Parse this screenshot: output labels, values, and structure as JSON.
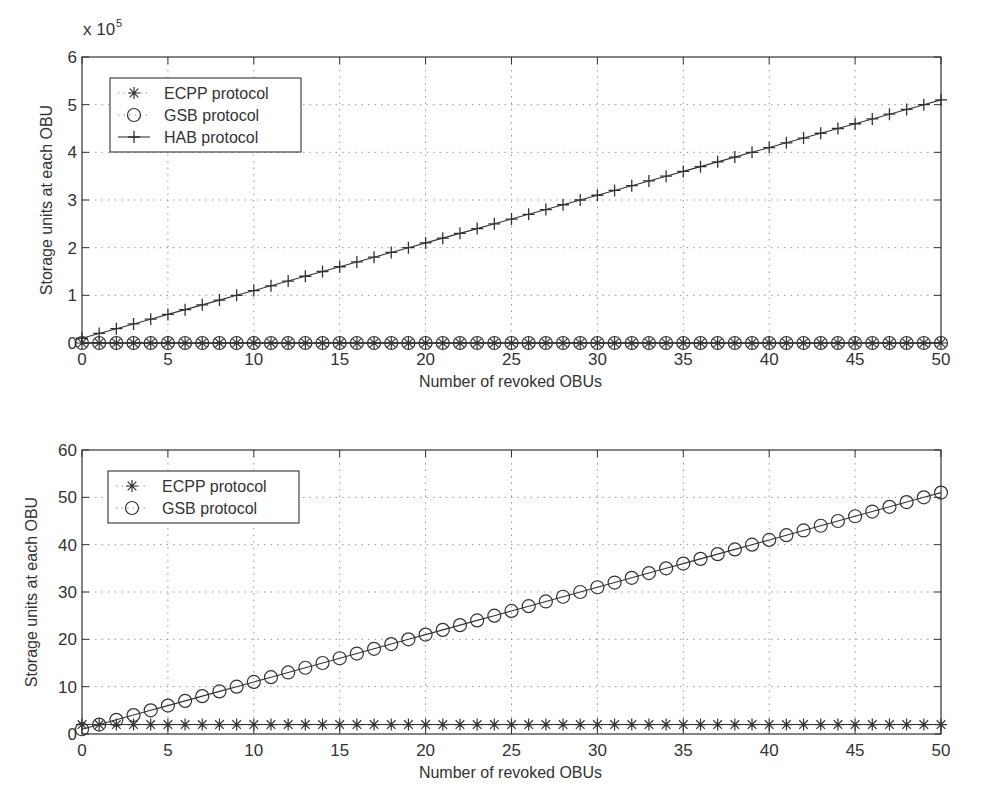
{
  "chart_data": [
    {
      "type": "line",
      "title": "",
      "xlabel": "Number of revoked OBUs",
      "ylabel": "Storage units at each OBU",
      "y_multiplier_label": "x 10",
      "y_multiplier_exponent": "5",
      "xlim": [
        0,
        50
      ],
      "ylim": [
        0,
        6
      ],
      "xticks": [
        "0",
        "5",
        "10",
        "15",
        "20",
        "25",
        "30",
        "35",
        "40",
        "45",
        "50"
      ],
      "yticks": [
        "0",
        "1",
        "2",
        "3",
        "4",
        "5",
        "6"
      ],
      "grid": true,
      "legend_position": "upper left",
      "x": [
        0,
        1,
        2,
        3,
        4,
        5,
        6,
        7,
        8,
        9,
        10,
        11,
        12,
        13,
        14,
        15,
        16,
        17,
        18,
        19,
        20,
        21,
        22,
        23,
        24,
        25,
        26,
        27,
        28,
        29,
        30,
        31,
        32,
        33,
        34,
        35,
        36,
        37,
        38,
        39,
        40,
        41,
        42,
        43,
        44,
        45,
        46,
        47,
        48,
        49,
        50
      ],
      "series": [
        {
          "name": "ECPP protocol",
          "marker": "star",
          "values_scaled_1e5": [
            2e-05,
            2e-05,
            2e-05,
            2e-05,
            2e-05,
            2e-05,
            2e-05,
            2e-05,
            2e-05,
            2e-05,
            2e-05,
            2e-05,
            2e-05,
            2e-05,
            2e-05,
            2e-05,
            2e-05,
            2e-05,
            2e-05,
            2e-05,
            2e-05,
            2e-05,
            2e-05,
            2e-05,
            2e-05,
            2e-05,
            2e-05,
            2e-05,
            2e-05,
            2e-05,
            2e-05,
            2e-05,
            2e-05,
            2e-05,
            2e-05,
            2e-05,
            2e-05,
            2e-05,
            2e-05,
            2e-05,
            2e-05,
            2e-05,
            2e-05,
            2e-05,
            2e-05,
            2e-05,
            2e-05,
            2e-05,
            2e-05,
            2e-05,
            2e-05
          ]
        },
        {
          "name": "GSB protocol",
          "marker": "circle",
          "values_scaled_1e5": [
            1e-05,
            2e-05,
            3e-05,
            4e-05,
            5e-05,
            6e-05,
            7e-05,
            8e-05,
            9e-05,
            0.0001,
            0.00011,
            0.00012,
            0.00013,
            0.00014,
            0.00015,
            0.00016,
            0.00017,
            0.00018,
            0.00019,
            0.0002,
            0.00021,
            0.00022,
            0.00023,
            0.00024,
            0.00025,
            0.00026,
            0.00027,
            0.00028,
            0.00029,
            0.0003,
            0.00031,
            0.00032,
            0.00033,
            0.00034,
            0.00035,
            0.00036,
            0.00037,
            0.00038,
            0.00039,
            0.0004,
            0.00041,
            0.00042,
            0.00043,
            0.00044,
            0.00045,
            0.00046,
            0.00047,
            0.00048,
            0.00049,
            0.0005,
            0.00051
          ]
        },
        {
          "name": "HAB protocol",
          "marker": "plus",
          "values_scaled_1e5": [
            0.1,
            0.2,
            0.3,
            0.4,
            0.5,
            0.6,
            0.7,
            0.8,
            0.9,
            1.0,
            1.1,
            1.2,
            1.3,
            1.4,
            1.5,
            1.6,
            1.7,
            1.8,
            1.9,
            2.0,
            2.1,
            2.2,
            2.3,
            2.4,
            2.5,
            2.6,
            2.7,
            2.8,
            2.9,
            3.0,
            3.1,
            3.2,
            3.3,
            3.4,
            3.5,
            3.6,
            3.7,
            3.8,
            3.9,
            4.0,
            4.1,
            4.2,
            4.3,
            4.4,
            4.5,
            4.6,
            4.7,
            4.8,
            4.9,
            5.0,
            5.1
          ]
        }
      ],
      "plot_box": {
        "x0": 82,
        "x1": 941,
        "y_top": 57,
        "y_bottom": 343
      }
    },
    {
      "type": "line",
      "title": "",
      "xlabel": "Number of revoked OBUs",
      "ylabel": "Storage units at each OBU",
      "xlim": [
        0,
        50
      ],
      "ylim": [
        0,
        60
      ],
      "xticks": [
        "0",
        "5",
        "10",
        "15",
        "20",
        "25",
        "30",
        "35",
        "40",
        "45",
        "50"
      ],
      "yticks": [
        "0",
        "10",
        "20",
        "30",
        "40",
        "50",
        "60"
      ],
      "grid": true,
      "legend_position": "upper left",
      "x": [
        0,
        1,
        2,
        3,
        4,
        5,
        6,
        7,
        8,
        9,
        10,
        11,
        12,
        13,
        14,
        15,
        16,
        17,
        18,
        19,
        20,
        21,
        22,
        23,
        24,
        25,
        26,
        27,
        28,
        29,
        30,
        31,
        32,
        33,
        34,
        35,
        36,
        37,
        38,
        39,
        40,
        41,
        42,
        43,
        44,
        45,
        46,
        47,
        48,
        49,
        50
      ],
      "series": [
        {
          "name": "ECPP protocol",
          "marker": "star",
          "values": [
            2,
            2,
            2,
            2,
            2,
            2,
            2,
            2,
            2,
            2,
            2,
            2,
            2,
            2,
            2,
            2,
            2,
            2,
            2,
            2,
            2,
            2,
            2,
            2,
            2,
            2,
            2,
            2,
            2,
            2,
            2,
            2,
            2,
            2,
            2,
            2,
            2,
            2,
            2,
            2,
            2,
            2,
            2,
            2,
            2,
            2,
            2,
            2,
            2,
            2,
            2
          ]
        },
        {
          "name": "GSB protocol",
          "marker": "circle",
          "values": [
            1,
            2,
            3,
            4,
            5,
            6,
            7,
            8,
            9,
            10,
            11,
            12,
            13,
            14,
            15,
            16,
            17,
            18,
            19,
            20,
            21,
            22,
            23,
            24,
            25,
            26,
            27,
            28,
            29,
            30,
            31,
            32,
            33,
            34,
            35,
            36,
            37,
            38,
            39,
            40,
            41,
            42,
            43,
            44,
            45,
            46,
            47,
            48,
            49,
            50,
            51
          ]
        }
      ],
      "plot_box": {
        "x0": 82,
        "x1": 941,
        "y_top": 450,
        "y_bottom": 734
      }
    }
  ],
  "colors": {
    "ink": "#333333",
    "grid": "#999999",
    "background": "#ffffff"
  }
}
